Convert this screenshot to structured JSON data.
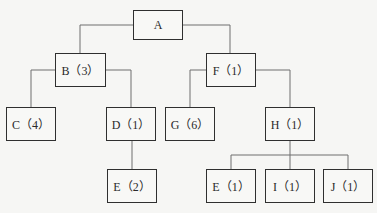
{
  "diagram": {
    "type": "tree",
    "nodes": [
      {
        "id": "A",
        "label": "A",
        "x": 133,
        "y": 10,
        "w": 50,
        "h": 30
      },
      {
        "id": "B",
        "label": "B（3）",
        "x": 55,
        "y": 53,
        "w": 51,
        "h": 34
      },
      {
        "id": "F",
        "label": "F（1）",
        "x": 206,
        "y": 53,
        "w": 50,
        "h": 34
      },
      {
        "id": "C",
        "label": "C（4）",
        "x": 6,
        "y": 107,
        "w": 50,
        "h": 34
      },
      {
        "id": "D",
        "label": "D（1）",
        "x": 106,
        "y": 107,
        "w": 50,
        "h": 34
      },
      {
        "id": "G",
        "label": "G（6）",
        "x": 165,
        "y": 107,
        "w": 50,
        "h": 34
      },
      {
        "id": "H",
        "label": "H（1）",
        "x": 265,
        "y": 107,
        "w": 50,
        "h": 34
      },
      {
        "id": "E2",
        "label": "E（2）",
        "x": 107,
        "y": 169,
        "w": 50,
        "h": 34
      },
      {
        "id": "E1",
        "label": "E（1）",
        "x": 206,
        "y": 169,
        "w": 50,
        "h": 34
      },
      {
        "id": "I",
        "label": "I（1）",
        "x": 265,
        "y": 169,
        "w": 50,
        "h": 34
      },
      {
        "id": "J",
        "label": "J（1）",
        "x": 323,
        "y": 169,
        "w": 50,
        "h": 34
      }
    ],
    "edges": [
      {
        "from": "A",
        "to": "B"
      },
      {
        "from": "A",
        "to": "F"
      },
      {
        "from": "B",
        "to": "C"
      },
      {
        "from": "B",
        "to": "D"
      },
      {
        "from": "F",
        "to": "G"
      },
      {
        "from": "F",
        "to": "H"
      },
      {
        "from": "D",
        "to": "E2"
      },
      {
        "from": "H",
        "to": "E1"
      },
      {
        "from": "H",
        "to": "I"
      },
      {
        "from": "H",
        "to": "J"
      }
    ]
  }
}
